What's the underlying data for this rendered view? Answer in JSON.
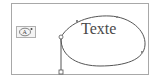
{
  "diagram": {
    "path_text": "Texte",
    "tool_icon": "text-on-path-icon",
    "colors": {
      "frame_border": "#a8a8a8",
      "path_stroke": "#555555",
      "text": "#4a4a4a",
      "handle_fill": "#ffffff"
    }
  }
}
